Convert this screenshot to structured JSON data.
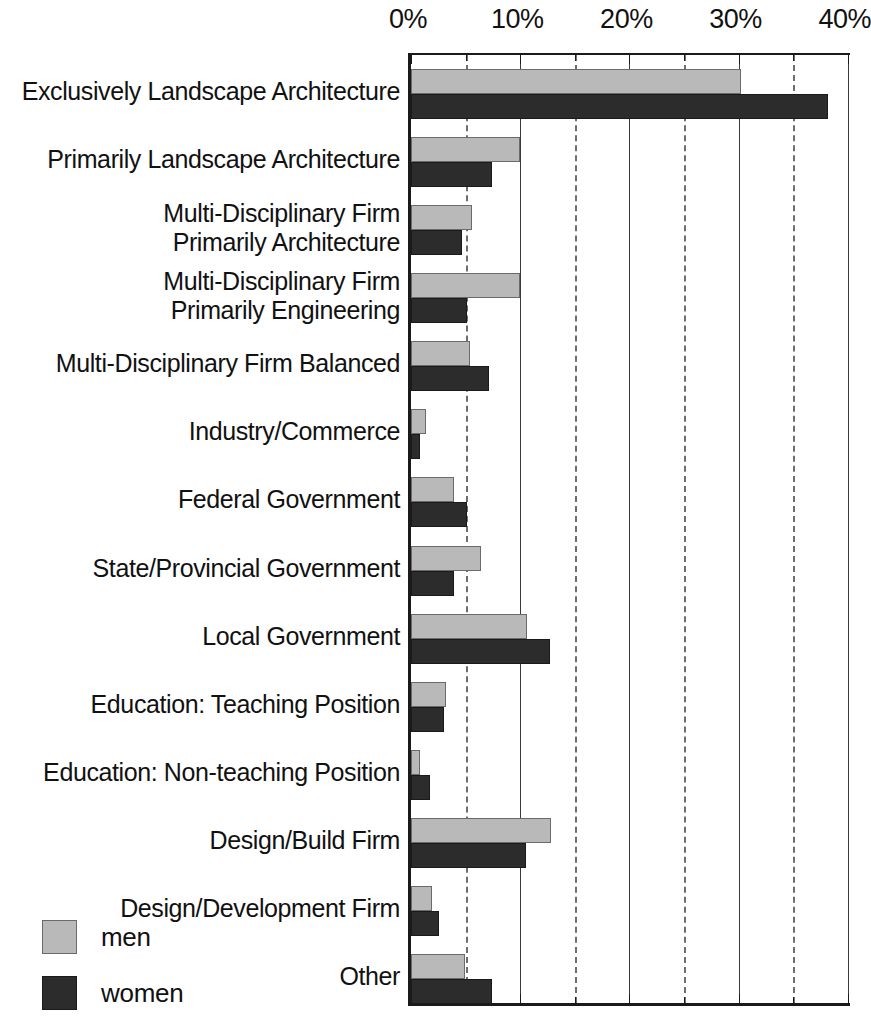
{
  "chart_data": {
    "type": "bar",
    "orientation": "horizontal",
    "title": "",
    "subtitle": "",
    "xlabel": "",
    "ylabel": "",
    "xlim": [
      0,
      40.5
    ],
    "xticks": [
      "0%",
      "10%",
      "20%",
      "30%",
      "40%"
    ],
    "xtick_values": [
      0,
      10,
      20,
      30,
      40
    ],
    "minor_xtick_values": [
      5,
      15,
      25,
      35
    ],
    "grid": "vertical major solid, minor dashed",
    "legend_position": "bottom-left",
    "categories": [
      "Exclusively  Landscape Architecture",
      "Primarily  Landscape Architecture",
      "Multi-Disciplinary Firm\nPrimarily Architecture",
      "Multi-Disciplinary Firm\nPrimarily Engineering",
      "Multi-Disciplinary Firm Balanced",
      "Industry/Commerce",
      "Federal Government",
      "State/Provincial Government",
      "Local Government",
      "Education: Teaching Position",
      "Education: Non-teaching Position",
      "Design/Build Firm",
      "Design/Development Firm",
      "Other"
    ],
    "series": [
      {
        "name": "men",
        "color": "#b9b9b9",
        "values": [
          30.2,
          10.0,
          5.6,
          10.0,
          5.4,
          1.4,
          3.9,
          6.4,
          10.6,
          3.2,
          0.8,
          12.8,
          1.9,
          4.9
        ]
      },
      {
        "name": "women",
        "color": "#2c2c2c",
        "values": [
          38.2,
          7.4,
          4.7,
          5.1,
          7.1,
          0.8,
          5.1,
          3.9,
          12.7,
          3.0,
          1.7,
          10.5,
          2.6,
          7.4
        ]
      }
    ]
  },
  "legend": {
    "items": [
      {
        "label": "men",
        "swatch": "men"
      },
      {
        "label": "women",
        "swatch": "women"
      }
    ]
  },
  "colors": {
    "men": "#b9b9b9",
    "women": "#2c2c2c",
    "axis": "#1a1a1a",
    "gridline_major": "#3a3a3a",
    "gridline_minor": "#6e6e6e",
    "background": "#ffffff"
  }
}
